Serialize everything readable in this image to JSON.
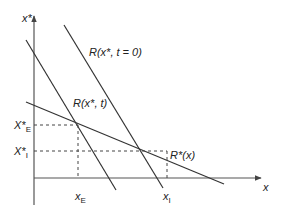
{
  "diagram": {
    "axes": {
      "y_label": "x*",
      "x_label": "x"
    },
    "curves": [
      {
        "id": "r_t0",
        "label": "R(x*, t = 0)"
      },
      {
        "id": "r_t",
        "label": "R(x*, t)"
      },
      {
        "id": "r_star",
        "label": "R*(x)"
      }
    ],
    "y_ticks": [
      {
        "id": "xstar_e",
        "main": "X*",
        "sub": "E"
      },
      {
        "id": "xstar_i",
        "main": "X*",
        "sub": "I"
      }
    ],
    "x_ticks": [
      {
        "id": "x_e",
        "main": "x",
        "sub": "E"
      },
      {
        "id": "x_i",
        "main": "x",
        "sub": "I"
      }
    ],
    "colors": {
      "line": "#333333",
      "axis": "#555555",
      "dashed": "#444444"
    }
  }
}
